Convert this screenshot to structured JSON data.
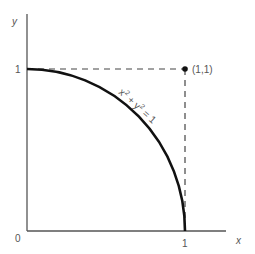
{
  "diagram": {
    "axes": {
      "x_label": "x",
      "y_label": "y",
      "origin_label": "0",
      "x_tick_label": "1",
      "y_tick_label": "1"
    },
    "point": {
      "label": "(1,1)"
    },
    "curve": {
      "equation_parts": [
        "x",
        "2",
        " + ",
        "y",
        "2",
        " = 1"
      ],
      "equation": "x² + y² = 1",
      "description": "quarter unit circle in first quadrant"
    },
    "colors": {
      "curve": "#111111",
      "axes": "#555555",
      "dashed": "#444444",
      "text": "#555555"
    }
  }
}
